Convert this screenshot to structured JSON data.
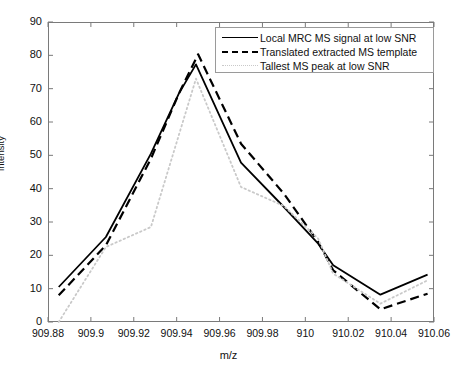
{
  "chart_data": {
    "type": "line",
    "title": "",
    "xlabel": "m/z",
    "ylabel": "intensity",
    "xlim": [
      909.88,
      910.06
    ],
    "ylim": [
      0,
      90
    ],
    "xticks": [
      "909.88",
      "909.9",
      "909.92",
      "909.94",
      "909.96",
      "909.98",
      "910",
      "910.02",
      "910.04",
      "910.06"
    ],
    "xtick_values": [
      909.88,
      909.9,
      909.92,
      909.94,
      909.96,
      909.98,
      910.0,
      910.02,
      910.04,
      910.06
    ],
    "yticks": [
      "0",
      "10",
      "20",
      "30",
      "40",
      "50",
      "60",
      "70",
      "80",
      "90"
    ],
    "ytick_values": [
      0,
      10,
      20,
      30,
      40,
      50,
      60,
      70,
      80,
      90
    ],
    "grid": false,
    "legend_position": "top-right",
    "series": [
      {
        "name": "Local MRC MS signal at low SNR",
        "style": "solid",
        "color": "#000000",
        "x": [
          909.885,
          909.907,
          909.928,
          909.941,
          909.949,
          909.97,
          909.99,
          910.006,
          910.013,
          910.035,
          910.057
        ],
        "y": [
          10.5,
          25.5,
          50.5,
          68.5,
          77.3,
          47.8,
          34.5,
          23.5,
          17.0,
          8.2,
          14.2
        ]
      },
      {
        "name": "Translated extracted MS template",
        "style": "dashed",
        "color": "#000000",
        "x": [
          909.885,
          909.907,
          909.928,
          909.941,
          909.95,
          909.97,
          909.99,
          910.006,
          910.013,
          910.035,
          910.057
        ],
        "y": [
          8.0,
          23.0,
          49.0,
          68.5,
          80.3,
          53.5,
          38.5,
          24.0,
          15.5,
          3.8,
          8.5
        ]
      },
      {
        "name": "Tallest MS peak at low SNR",
        "style": "dotted",
        "color": "#c9c9c9",
        "x": [
          909.885,
          909.907,
          909.928,
          909.949,
          909.97,
          909.99,
          910.006,
          910.013,
          910.035,
          910.057
        ],
        "y": [
          0.0,
          22.5,
          28.5,
          73.0,
          40.5,
          34.8,
          25.0,
          14.5,
          5.5,
          12.5
        ]
      }
    ]
  },
  "legend": {
    "entries": [
      {
        "label": "Local MRC MS signal at low SNR"
      },
      {
        "label": "Translated extracted MS template"
      },
      {
        "label": "Tallest MS peak at low SNR"
      }
    ]
  }
}
